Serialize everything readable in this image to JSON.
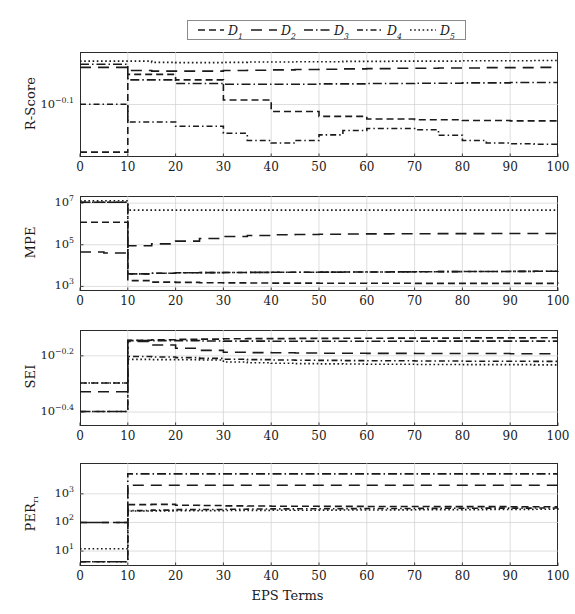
{
  "figure": {
    "width": 575,
    "height": 614,
    "xlabel": "EPS Terms",
    "series_color": "#1a1a1a",
    "frame_color": "#2b2b2b",
    "grid_color": "#d0d0d0"
  },
  "legend": {
    "position": "top-center",
    "entries": [
      {
        "name": "D1",
        "label": "D",
        "sub": "1",
        "dash": "7,4"
      },
      {
        "name": "D2",
        "label": "D",
        "sub": "2",
        "dash": "11,7"
      },
      {
        "name": "D3",
        "label": "D",
        "sub": "3",
        "dash": "9,3,1.5,3"
      },
      {
        "name": "D4",
        "label": "D",
        "sub": "4",
        "dash": "6,3,1.5,3"
      },
      {
        "name": "D5",
        "label": "D",
        "sub": "5",
        "dash": "1.6,2.6"
      }
    ]
  },
  "chart_data": [
    {
      "type": "line",
      "panel": "r-score",
      "ylabel": "R-Score",
      "xlabel": "",
      "xlim": [
        0,
        100
      ],
      "xticks": [
        0,
        10,
        20,
        30,
        40,
        50,
        60,
        70,
        80,
        90,
        100
      ],
      "yscale": "log",
      "ylim": [
        0.6607,
        0.955
      ],
      "yticks": [
        0.7943
      ],
      "ytick_labels": [
        "10^-0.1"
      ],
      "grid": true,
      "x": [
        0,
        5,
        10,
        15,
        20,
        25,
        30,
        35,
        40,
        45,
        50,
        55,
        60,
        65,
        70,
        75,
        80,
        85,
        90,
        95,
        100
      ],
      "series": [
        {
          "name": "D1",
          "values": [
            0.672,
            0.672,
            0.883,
            0.883,
            0.866,
            0.866,
            0.807,
            0.807,
            0.775,
            0.775,
            0.762,
            0.762,
            0.755,
            0.755,
            0.753,
            0.753,
            0.751,
            0.751,
            0.75,
            0.75,
            0.749
          ]
        },
        {
          "name": "D2",
          "values": [
            0.905,
            0.905,
            0.895,
            0.893,
            0.893,
            0.893,
            0.895,
            0.896,
            0.897,
            0.898,
            0.899,
            0.9,
            0.901,
            0.902,
            0.902,
            0.903,
            0.903,
            0.904,
            0.904,
            0.905,
            0.905
          ]
        },
        {
          "name": "D3",
          "values": [
            0.915,
            0.915,
            0.866,
            0.866,
            0.855,
            0.855,
            0.853,
            0.853,
            0.853,
            0.853,
            0.854,
            0.854,
            0.855,
            0.855,
            0.856,
            0.856,
            0.857,
            0.857,
            0.858,
            0.858,
            0.858
          ]
        },
        {
          "name": "D4",
          "values": [
            0.795,
            0.795,
            0.747,
            0.747,
            0.736,
            0.736,
            0.718,
            0.7,
            0.694,
            0.7,
            0.714,
            0.725,
            0.73,
            0.73,
            0.727,
            0.713,
            0.7,
            0.694,
            0.692,
            0.691,
            0.69
          ]
        },
        {
          "name": "D5",
          "values": [
            0.925,
            0.925,
            0.925,
            0.921,
            0.92,
            0.92,
            0.921,
            0.922,
            0.922,
            0.923,
            0.923,
            0.924,
            0.924,
            0.925,
            0.925,
            0.925,
            0.926,
            0.926,
            0.926,
            0.927,
            0.927
          ]
        }
      ]
    },
    {
      "type": "line",
      "panel": "mpe",
      "ylabel": "MPE",
      "xlabel": "",
      "xlim": [
        0,
        100
      ],
      "xticks": [
        0,
        10,
        20,
        30,
        40,
        50,
        60,
        70,
        80,
        90,
        100
      ],
      "yscale": "log",
      "ylim": [
        600,
        22000000
      ],
      "yticks": [
        1000,
        100000,
        10000000
      ],
      "ytick_labels": [
        "10^3",
        "10^5",
        "10^7"
      ],
      "grid": true,
      "x": [
        0,
        5,
        10,
        15,
        20,
        25,
        30,
        35,
        40,
        45,
        50,
        55,
        60,
        65,
        70,
        75,
        80,
        85,
        90,
        95,
        100
      ],
      "series": [
        {
          "name": "D1",
          "values": [
            1200000,
            1200000,
            1900,
            1600,
            1550,
            1500,
            1470,
            1450,
            1440,
            1430,
            1420,
            1415,
            1410,
            1405,
            1400,
            1400,
            1398,
            1396,
            1395,
            1394,
            1393
          ]
        },
        {
          "name": "D2",
          "values": [
            45000,
            40000,
            90000,
            110000,
            150000,
            200000,
            250000,
            280000,
            300000,
            310000,
            320000,
            330000,
            335000,
            338000,
            340000,
            342000,
            344000,
            345000,
            346000,
            347000,
            348000
          ]
        },
        {
          "name": "D3",
          "values": [
            11000000,
            11000000,
            4000,
            4300,
            4500,
            4600,
            4650,
            4700,
            4750,
            4800,
            4850,
            4900,
            4950,
            5000,
            5050,
            5100,
            5150,
            5200,
            5250,
            5300,
            5400
          ]
        },
        {
          "name": "D4",
          "values": [
            11000000,
            11000000,
            4000,
            4300,
            4500,
            4600,
            4650,
            4700,
            4750,
            4800,
            4850,
            4900,
            4950,
            5000,
            5050,
            5100,
            5150,
            5200,
            5250,
            5300,
            5400
          ]
        },
        {
          "name": "D5",
          "values": [
            13000000,
            13000000,
            4600000,
            4600000,
            4600000,
            4600000,
            4600000,
            4600000,
            4600000,
            4600000,
            4600000,
            4600000,
            4600000,
            4600000,
            4600000,
            4600000,
            4600000,
            4600000,
            4600000,
            4600000,
            4600000
          ]
        }
      ]
    },
    {
      "type": "line",
      "panel": "sei",
      "ylabel": "SEI",
      "xlabel": "",
      "xlim": [
        0,
        100
      ],
      "xticks": [
        0,
        10,
        20,
        30,
        40,
        50,
        60,
        70,
        80,
        90,
        100
      ],
      "yscale": "log",
      "ylim": [
        0.355,
        0.78
      ],
      "yticks": [
        0.631,
        0.398
      ],
      "ytick_labels": [
        "10^-0.2",
        "10^-0.4"
      ],
      "grid": true,
      "x": [
        0,
        5,
        10,
        15,
        20,
        25,
        30,
        35,
        40,
        45,
        50,
        55,
        60,
        65,
        70,
        75,
        80,
        85,
        90,
        95,
        100
      ],
      "series": [
        {
          "name": "D1",
          "values": [
            0.505,
            0.505,
            0.717,
            0.72,
            0.722,
            0.724,
            0.726,
            0.727,
            0.727,
            0.728,
            0.728,
            0.729,
            0.729,
            0.73,
            0.73,
            0.73,
            0.731,
            0.731,
            0.731,
            0.732,
            0.732
          ]
        },
        {
          "name": "D2",
          "values": [
            0.47,
            0.47,
            0.71,
            0.69,
            0.672,
            0.66,
            0.65,
            0.648,
            0.647,
            0.646,
            0.645,
            0.645,
            0.644,
            0.644,
            0.643,
            0.643,
            0.643,
            0.643,
            0.642,
            0.642,
            0.642
          ]
        },
        {
          "name": "D3",
          "values": [
            0.4,
            0.4,
            0.715,
            0.715,
            0.715,
            0.713,
            0.712,
            0.712,
            0.711,
            0.711,
            0.711,
            0.711,
            0.711,
            0.711,
            0.711,
            0.712,
            0.712,
            0.712,
            0.712,
            0.712,
            0.712
          ]
        },
        {
          "name": "D4",
          "values": [
            0.4,
            0.4,
            0.628,
            0.625,
            0.622,
            0.618,
            0.614,
            0.612,
            0.61,
            0.609,
            0.608,
            0.607,
            0.606,
            0.606,
            0.605,
            0.605,
            0.604,
            0.604,
            0.604,
            0.603,
            0.603
          ]
        },
        {
          "name": "D5",
          "values": [
            0.505,
            0.505,
            0.613,
            0.612,
            0.611,
            0.61,
            0.6,
            0.596,
            0.594,
            0.592,
            0.591,
            0.59,
            0.589,
            0.589,
            0.588,
            0.588,
            0.587,
            0.587,
            0.587,
            0.586,
            0.586
          ]
        }
      ]
    },
    {
      "type": "line",
      "panel": "per",
      "ylabel": "PER",
      "ylabel_sub": "r1",
      "xlabel": "EPS Terms",
      "xlim": [
        0,
        100
      ],
      "xticks": [
        0,
        10,
        20,
        30,
        40,
        50,
        60,
        70,
        80,
        90,
        100
      ],
      "yscale": "log",
      "ylim": [
        3.0,
        12000
      ],
      "yticks": [
        10,
        100,
        1000
      ],
      "ytick_labels": [
        "10^1",
        "10^2",
        "10^3"
      ],
      "grid": true,
      "x": [
        0,
        5,
        10,
        15,
        20,
        25,
        30,
        35,
        40,
        45,
        50,
        55,
        60,
        65,
        70,
        75,
        80,
        85,
        90,
        95,
        100
      ],
      "series": [
        {
          "name": "D1",
          "values": [
            100,
            100,
            420,
            430,
            400,
            390,
            380,
            375,
            370,
            368,
            366,
            364,
            362,
            361,
            360,
            359,
            358,
            357,
            356,
            355,
            355
          ]
        },
        {
          "name": "D2",
          "values": [
            100,
            100,
            2000,
            2000,
            2000,
            2000,
            2000,
            2000,
            2000,
            2000,
            2000,
            2000,
            2000,
            2000,
            2000,
            2000,
            2000,
            2000,
            2000,
            2000,
            2000
          ]
        },
        {
          "name": "D3",
          "values": [
            4.2,
            4.2,
            5000,
            5000,
            5000,
            5000,
            5000,
            5000,
            5000,
            5000,
            5000,
            5000,
            5000,
            5000,
            5000,
            5000,
            5000,
            5000,
            5000,
            5000,
            5000
          ]
        },
        {
          "name": "D4",
          "values": [
            4.2,
            4.2,
            260,
            270,
            280,
            285,
            290,
            295,
            298,
            300,
            302,
            304,
            306,
            308,
            310,
            312,
            314,
            316,
            318,
            320,
            322
          ]
        },
        {
          "name": "D5",
          "values": [
            12,
            12,
            250,
            255,
            258,
            260,
            262,
            264,
            266,
            268,
            270,
            272,
            274,
            276,
            278,
            280,
            282,
            284,
            286,
            288,
            290
          ]
        }
      ]
    }
  ]
}
